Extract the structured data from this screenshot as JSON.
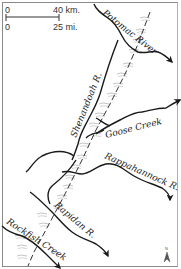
{
  "map": {
    "scale": {
      "km_zero": "0",
      "km_label": "40 km.",
      "mi_zero": "0",
      "mi_label": "25 mi."
    },
    "rivers": [
      {
        "name": "Potomac River",
        "label": "Potomac River"
      },
      {
        "name": "Shenandoah R.",
        "label": "Shenandoah R."
      },
      {
        "name": "Goose Creek",
        "label": "Goose Creek"
      },
      {
        "name": "Rappahannock R.",
        "label": "Rappahannock R."
      },
      {
        "name": "Rapidan R.",
        "label": "Rapidan R."
      },
      {
        "name": "Rockfish Creek",
        "label": "Rockfish Creek"
      }
    ],
    "north_arrow": {
      "label": "N"
    },
    "colors": {
      "river": "#1a1a1a",
      "ridge_shading": "#b8b8b8",
      "dashed_line": "#333333",
      "frame": "#8a8a8a"
    }
  }
}
